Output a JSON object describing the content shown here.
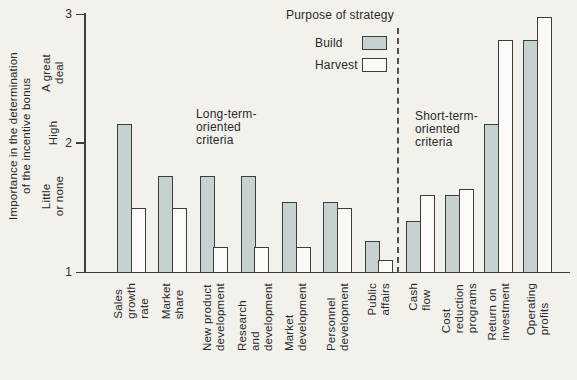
{
  "figure": {
    "y_axis": {
      "title": "Importance in the determination\nof the incentive bonus",
      "tick_labels": [
        "3",
        "2",
        "1"
      ],
      "scale_labels": [
        "A great\ndeal",
        "High",
        "Little\nor none"
      ]
    },
    "legend": {
      "title": "Purpose of strategy",
      "items": [
        {
          "label": "Build"
        },
        {
          "label": "Harvest"
        }
      ]
    },
    "annotations": {
      "long_term": "Long-term-\noriented\ncriteria",
      "short_term": "Short-term-\noriented\ncriteria"
    }
  },
  "chart_data": {
    "type": "bar",
    "title": "",
    "xlabel": "",
    "ylabel": "Importance in the determination of the incentive bonus",
    "ylim": [
      1,
      3
    ],
    "yticks": [
      1,
      2,
      3
    ],
    "ytick_qualitative": {
      "1": "Little or none",
      "2": "High",
      "3": "A great deal"
    },
    "grid": false,
    "legend_title": "Purpose of strategy",
    "legend_position": "top",
    "colors": {
      "build": "#c5d2cf",
      "harvest": "#fbfaf6",
      "outline": "#3d3d3d"
    },
    "groups": [
      {
        "label": "Long-term-oriented criteria",
        "categories": [
          "Sales growth rate",
          "Market share",
          "New product development",
          "Research and development",
          "Market development",
          "Personnel development",
          "Public affairs"
        ],
        "categories_display": [
          "Sales\ngrowth rate",
          "Market share",
          "New product\ndevelopment",
          "Research and\ndevelopment",
          "Market\ndevelopment",
          "Personnel\ndevelopment",
          "Public affairs"
        ],
        "series": [
          {
            "name": "Build",
            "values": [
              2.15,
              1.75,
              1.75,
              1.75,
              1.55,
              1.55,
              1.25
            ]
          },
          {
            "name": "Harvest",
            "values": [
              1.5,
              1.5,
              1.2,
              1.2,
              1.2,
              1.5,
              1.1
            ]
          }
        ]
      },
      {
        "label": "Short-term-oriented criteria",
        "categories": [
          "Cash flow",
          "Cost reduction programs",
          "Return on investment",
          "Operating profits"
        ],
        "categories_display": [
          "Cash flow",
          "Cost reduction\nprograms",
          "Return on\ninvestment",
          "Operating\nprofits"
        ],
        "series": [
          {
            "name": "Build",
            "values": [
              1.4,
              1.6,
              2.15,
              2.8
            ]
          },
          {
            "name": "Harvest",
            "values": [
              1.6,
              1.65,
              2.8,
              2.98
            ]
          }
        ]
      }
    ]
  }
}
